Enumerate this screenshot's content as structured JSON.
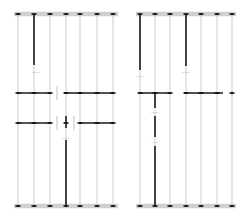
{
  "diagram": {
    "background_color": "#ffffff",
    "width": 249,
    "height": 223,
    "colors": {
      "rail_light": "#b8b8b8",
      "rail_dark": "#1a1a1a",
      "header_bar": "#d0d0d0",
      "node": "#111111",
      "label_text": "#8a8a8a"
    },
    "geometry": {
      "top_bar_y": 14,
      "bottom_bar_y": 206,
      "bar_thickness": 4.5,
      "node_cap_width": 5,
      "node_cap_height": 1.6,
      "rail_width_light": 0.7,
      "rail_width_dark": 1.6,
      "connector_width": 1.5
    },
    "panels": [
      {
        "id": "panel-left",
        "name": "left-panel",
        "x_start": 16,
        "x_end": 116,
        "columns": [
          {
            "id": "L1",
            "x": 18,
            "weight": "light"
          },
          {
            "id": "L2",
            "x": 34,
            "weight": "light"
          },
          {
            "id": "L3",
            "x": 50,
            "weight": "light"
          },
          {
            "id": "L4",
            "x": 66,
            "weight": "light"
          },
          {
            "id": "L5",
            "x": 80,
            "weight": "light"
          },
          {
            "id": "L6",
            "x": 97,
            "weight": "light"
          },
          {
            "id": "L7",
            "x": 113,
            "weight": "light"
          }
        ],
        "dark_segments": [
          {
            "id": "LD1",
            "x": 34,
            "y1": 14,
            "y2": 65
          },
          {
            "id": "LD2",
            "x": 66,
            "y1": 140,
            "y2": 206
          },
          {
            "id": "LD3",
            "x": 66,
            "y1": 116,
            "y2": 128
          }
        ],
        "connectors": [
          {
            "id": "LC1",
            "y": 93,
            "x1": 18,
            "x2": 50
          },
          {
            "id": "LC2",
            "y": 93,
            "x1": 64,
            "x2": 113
          },
          {
            "id": "LC3",
            "y": 123,
            "x1": 18,
            "x2": 50
          },
          {
            "id": "LC4",
            "y": 123,
            "x1": 80,
            "x2": 113
          }
        ],
        "tick_marks": [
          {
            "id": "LT1",
            "x": 57,
            "y1": 86,
            "y2": 100
          },
          {
            "id": "LT2",
            "x": 57,
            "y1": 116,
            "y2": 130
          },
          {
            "id": "LT3",
            "x": 74,
            "y1": 116,
            "y2": 130
          }
        ],
        "nodes": [
          {
            "x": 18,
            "y": 14
          },
          {
            "x": 34,
            "y": 14
          },
          {
            "x": 50,
            "y": 14
          },
          {
            "x": 66,
            "y": 14
          },
          {
            "x": 80,
            "y": 14
          },
          {
            "x": 97,
            "y": 14
          },
          {
            "x": 113,
            "y": 14
          },
          {
            "x": 18,
            "y": 93
          },
          {
            "x": 34,
            "y": 93
          },
          {
            "x": 50,
            "y": 93
          },
          {
            "x": 66,
            "y": 93
          },
          {
            "x": 80,
            "y": 93
          },
          {
            "x": 97,
            "y": 93
          },
          {
            "x": 113,
            "y": 93
          },
          {
            "x": 18,
            "y": 123
          },
          {
            "x": 34,
            "y": 123
          },
          {
            "x": 50,
            "y": 123
          },
          {
            "x": 66,
            "y": 123
          },
          {
            "x": 80,
            "y": 123
          },
          {
            "x": 97,
            "y": 123
          },
          {
            "x": 113,
            "y": 123
          },
          {
            "x": 18,
            "y": 206
          },
          {
            "x": 34,
            "y": 206
          },
          {
            "x": 50,
            "y": 206
          },
          {
            "x": 66,
            "y": 206
          },
          {
            "x": 80,
            "y": 206
          },
          {
            "x": 97,
            "y": 206
          },
          {
            "x": 113,
            "y": 206
          }
        ],
        "labels": [
          {
            "id": "LL1",
            "x": 36,
            "y": 72,
            "text": "———"
          },
          {
            "id": "LL2",
            "x": 66,
            "y": 138,
            "text": "———"
          }
        ]
      },
      {
        "id": "panel-right",
        "name": "right-panel",
        "x_start": 138,
        "x_end": 234,
        "columns": [
          {
            "id": "R1",
            "x": 140,
            "weight": "light"
          },
          {
            "id": "R2",
            "x": 155,
            "weight": "light"
          },
          {
            "id": "R3",
            "x": 170,
            "weight": "light"
          },
          {
            "id": "R4",
            "x": 186,
            "weight": "light"
          },
          {
            "id": "R5",
            "x": 201,
            "weight": "light"
          },
          {
            "id": "R6",
            "x": 217,
            "weight": "light"
          },
          {
            "id": "R7",
            "x": 232,
            "weight": "light"
          }
        ],
        "dark_segments": [
          {
            "id": "RD1",
            "x": 140,
            "y1": 14,
            "y2": 70
          },
          {
            "id": "RD2",
            "x": 186,
            "y1": 14,
            "y2": 66
          },
          {
            "id": "RD3",
            "x": 155,
            "y1": 93,
            "y2": 108
          },
          {
            "id": "RD4",
            "x": 155,
            "y1": 116,
            "y2": 137
          },
          {
            "id": "RD5",
            "x": 155,
            "y1": 146,
            "y2": 206
          }
        ],
        "connectors": [
          {
            "id": "RC1",
            "y": 93,
            "x1": 140,
            "x2": 170
          },
          {
            "id": "RC2",
            "y": 93,
            "x1": 184,
            "x2": 223
          }
        ],
        "tick_marks": [
          {
            "id": "RT1",
            "x": 232,
            "y1": 90,
            "y2": 96
          }
        ],
        "nodes": [
          {
            "x": 140,
            "y": 14
          },
          {
            "x": 155,
            "y": 14
          },
          {
            "x": 170,
            "y": 14
          },
          {
            "x": 186,
            "y": 14
          },
          {
            "x": 201,
            "y": 14
          },
          {
            "x": 217,
            "y": 14
          },
          {
            "x": 232,
            "y": 14
          },
          {
            "x": 140,
            "y": 93
          },
          {
            "x": 155,
            "y": 93
          },
          {
            "x": 170,
            "y": 93
          },
          {
            "x": 186,
            "y": 93
          },
          {
            "x": 201,
            "y": 93
          },
          {
            "x": 217,
            "y": 93
          },
          {
            "x": 232,
            "y": 93
          },
          {
            "x": 140,
            "y": 206
          },
          {
            "x": 155,
            "y": 206
          },
          {
            "x": 170,
            "y": 206
          },
          {
            "x": 186,
            "y": 206
          },
          {
            "x": 201,
            "y": 206
          },
          {
            "x": 217,
            "y": 206
          },
          {
            "x": 232,
            "y": 206
          }
        ],
        "labels": [
          {
            "id": "RL1",
            "x": 140,
            "y": 76,
            "text": "———"
          },
          {
            "id": "RL2",
            "x": 186,
            "y": 72,
            "text": "———"
          },
          {
            "id": "RL3",
            "x": 155,
            "y": 112,
            "text": "———"
          },
          {
            "id": "RL4",
            "x": 155,
            "y": 142,
            "text": "———"
          }
        ]
      }
    ]
  }
}
